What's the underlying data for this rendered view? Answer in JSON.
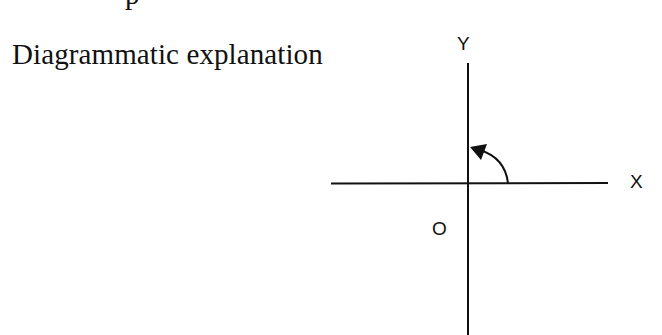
{
  "document": {
    "cropped_top_text": "p",
    "heading": "Diagrammatic explanation"
  },
  "diagram": {
    "type": "coordinate-axes",
    "labels": {
      "y_axis": "Y",
      "x_axis": "X",
      "origin": "O"
    },
    "rotation_arrow": {
      "direction": "counter-clockwise",
      "from": "positive X axis",
      "to": "positive Y axis",
      "angle_deg": 90
    },
    "colors": {
      "line": "#111111",
      "background": "#ffffff"
    }
  }
}
